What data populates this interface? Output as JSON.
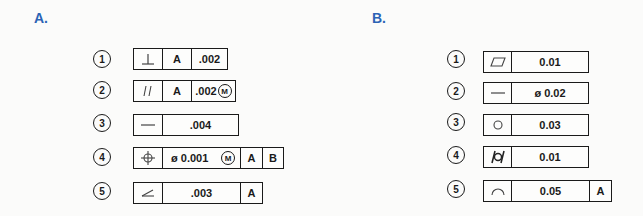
{
  "sections": {
    "a": {
      "label": "A.",
      "rows": [
        {
          "num": "1",
          "symbol": "perpendicularity-icon",
          "datum1": "A",
          "tolerance": ".002"
        },
        {
          "num": "2",
          "symbol": "parallelism-icon",
          "datum1": "A",
          "tolerance": ".002",
          "modifier": "M"
        },
        {
          "num": "3",
          "symbol": "straightness-icon",
          "tolerance": ".004"
        },
        {
          "num": "4",
          "symbol": "position-icon",
          "diameter": "ø",
          "tolerance": "0.001",
          "modifier": "M",
          "datum1": "A",
          "datum2": "B"
        },
        {
          "num": "5",
          "symbol": "angularity-icon",
          "tolerance": ".003",
          "datum1": "A"
        }
      ]
    },
    "b": {
      "label": "B.",
      "rows": [
        {
          "num": "1",
          "symbol": "flatness-icon",
          "tolerance": "0.01"
        },
        {
          "num": "2",
          "symbol": "straightness-icon",
          "diameter": "ø",
          "tolerance": "0.02"
        },
        {
          "num": "3",
          "symbol": "circularity-icon",
          "tolerance": "0.03"
        },
        {
          "num": "4",
          "symbol": "cylindricity-icon",
          "tolerance": "0.01"
        },
        {
          "num": "5",
          "symbol": "profile-of-line-icon",
          "tolerance": "0.05",
          "datum1": "A"
        }
      ]
    }
  },
  "colors": {
    "label": "#2b63b5",
    "ink": "#1a1a1a"
  }
}
